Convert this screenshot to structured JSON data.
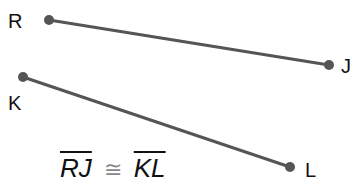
{
  "points": {
    "R": {
      "label": "R",
      "x": 49,
      "y": 20
    },
    "J": {
      "label": "J",
      "x": 329,
      "y": 65
    },
    "K": {
      "label": "K",
      "x": 23,
      "y": 77
    },
    "L": {
      "label": "L",
      "x": 290,
      "y": 167
    }
  },
  "segments": [
    {
      "from": "R",
      "to": "J"
    },
    {
      "from": "K",
      "to": "L"
    }
  ],
  "statement": {
    "left": "RJ",
    "relation": "≅",
    "right": "KL"
  },
  "colors": {
    "line": "#555555",
    "point": "#555555",
    "text": "#111111"
  }
}
